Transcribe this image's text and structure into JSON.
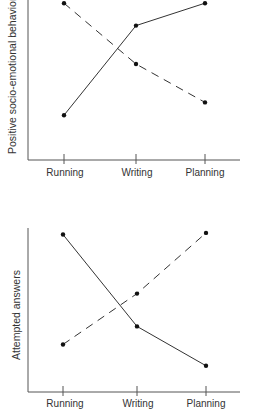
{
  "chart_data": [
    {
      "type": "line",
      "title": "",
      "xlabel": "",
      "ylabel": "Positive socio-emotional behavior",
      "categories": [
        "Running",
        "Writing",
        "Planning"
      ],
      "ylim": [
        0,
        1
      ],
      "grid": false,
      "legend": "none",
      "series": [
        {
          "name": "solid",
          "style": "solid",
          "values": [
            0.28,
            0.84,
            0.98
          ]
        },
        {
          "name": "dashed",
          "style": "dashed",
          "values": [
            0.98,
            0.6,
            0.36
          ]
        }
      ]
    },
    {
      "type": "line",
      "title": "",
      "xlabel": "",
      "ylabel": "Attempted answers",
      "categories": [
        "Running",
        "Writing",
        "Planning"
      ],
      "ylim": [
        0,
        1
      ],
      "grid": false,
      "legend": "none",
      "series": [
        {
          "name": "solid",
          "style": "solid",
          "values": [
            0.96,
            0.4,
            0.16
          ]
        },
        {
          "name": "dashed",
          "style": "dashed",
          "values": [
            0.29,
            0.6,
            0.97
          ]
        }
      ]
    }
  ],
  "colors": {
    "line": "#333333",
    "axis": "#555555"
  }
}
